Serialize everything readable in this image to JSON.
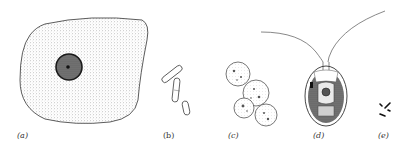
{
  "figure": {
    "panels": [
      {
        "id": "a",
        "label": "(a)",
        "subject": "large-cell-with-nucleus"
      },
      {
        "id": "b",
        "label": "(b)",
        "subject": "rod-shaped-cells"
      },
      {
        "id": "c",
        "label": "(c)",
        "subject": "budding-spherical-cells-cluster"
      },
      {
        "id": "d",
        "label": "(d)",
        "subject": "biflagellate-cell"
      },
      {
        "id": "e",
        "label": "(e)",
        "subject": "tiny-rod-particles"
      }
    ],
    "colors": {
      "ink": "#333333",
      "stipple": "#9a9a9a",
      "dark": "#222222",
      "background": "#ffffff"
    }
  }
}
